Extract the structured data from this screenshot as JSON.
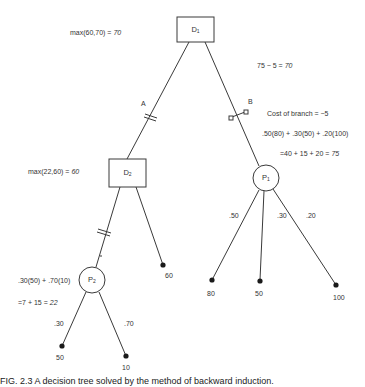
{
  "nodes": {
    "D1": {
      "name": "D",
      "sub": "1",
      "type": "decision"
    },
    "D2": {
      "name": "D",
      "sub": "2",
      "type": "decision"
    },
    "P1": {
      "name": "P",
      "sub": "1",
      "type": "chance"
    },
    "P2": {
      "name": "P",
      "sub": "2",
      "type": "chance"
    }
  },
  "annotations": {
    "d1_value": {
      "expr": "max(60,70) = ",
      "result": "70"
    },
    "branch_b_value": {
      "expr": "75 − 5 = ",
      "result": "70"
    },
    "branch_a_label": "A",
    "branch_b_label": "B",
    "branch_b_cost": "Cost of branch = −5",
    "p1_ev_formula": ".50(80) + .30(50) + .20(100)",
    "p1_ev_result": {
      "expr": "=40 + 15 + 20 = ",
      "result": "75"
    },
    "d2_value": {
      "expr": "max(22,60) = ",
      "result": "60"
    },
    "p2_ev_formula": ".30(50) + .70(10)",
    "p2_ev_result": {
      "expr": "=7 + 15 = ",
      "result": "22"
    }
  },
  "probabilities": {
    "p1": [
      ".50",
      ".30",
      ".20"
    ],
    "p2": [
      ".30",
      ".70"
    ]
  },
  "payoffs": {
    "p1": [
      "80",
      "50",
      "100"
    ],
    "d2_direct": "60",
    "p2": [
      "50",
      "10"
    ]
  },
  "caption": "FIG. 2.3   A decision tree solved by the method of backward induction."
}
